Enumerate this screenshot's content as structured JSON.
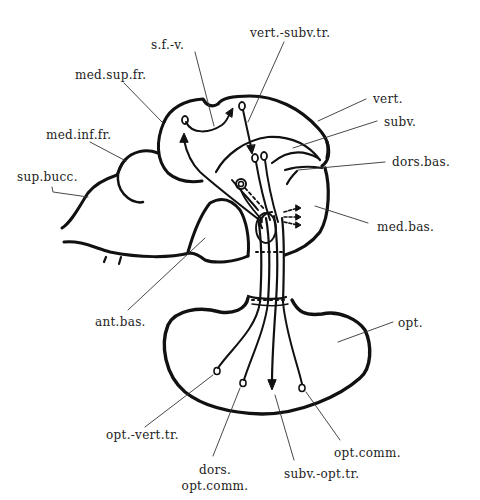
{
  "labels": {
    "sfv": "s.f.-v.",
    "vert_subv_tr": "vert.-subv.tr.",
    "med_sup_fr": "med.sup.fr.",
    "vert": "vert.",
    "subv": "subv.",
    "med_inf_fr": "med.inf.fr.",
    "dors_bas": "dors.bas.",
    "sup_bucc": "sup.bucc.",
    "med_bas": "med.bas.",
    "ant_bas": "ant.bas.",
    "opt": "opt.",
    "opt_vert_tr": "opt.-vert.tr.",
    "opt_comm": "opt.comm.",
    "dors_opt_comm_1": "dors.",
    "dors_opt_comm_2": "opt.comm.",
    "subv_opt_tr": "subv.-opt.tr."
  },
  "colors": {
    "ink": "#111111",
    "text": "#222222",
    "background": "#ffffff"
  }
}
